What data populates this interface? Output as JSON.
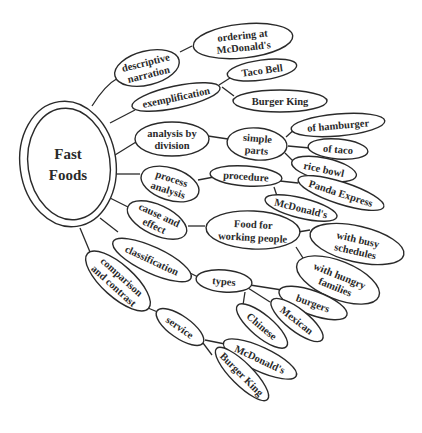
{
  "diagram": {
    "type": "cluster-map",
    "center": {
      "line1": "Fast",
      "line2": "Foods"
    },
    "branches": [
      {
        "label": [
          "descriptive",
          "narration"
        ],
        "children": [
          {
            "label": [
              "ordering at",
              "McDonald's"
            ]
          }
        ]
      },
      {
        "label": [
          "exemplification"
        ],
        "children": [
          {
            "label": [
              "Taco Bell"
            ]
          },
          {
            "label": [
              "Burger King"
            ]
          }
        ]
      },
      {
        "label": [
          "analysis by",
          "division"
        ],
        "children": [
          {
            "label": [
              "simple",
              "parts"
            ],
            "children": [
              {
                "label": [
                  "of hamburger"
                ]
              },
              {
                "label": [
                  "of taco"
                ]
              },
              {
                "label": [
                  "rice bowl"
                ]
              }
            ]
          }
        ]
      },
      {
        "label": [
          "process",
          "analysis"
        ],
        "children": [
          {
            "label": [
              "procedure"
            ],
            "children": [
              {
                "label": [
                  "Panda Express"
                ]
              },
              {
                "label": [
                  "McDonald's"
                ]
              }
            ]
          }
        ]
      },
      {
        "label": [
          "cause and",
          "effect"
        ],
        "children": [
          {
            "label": [
              "Food for",
              "working people"
            ],
            "children": [
              {
                "label": [
                  "with busy",
                  "schedules"
                ]
              },
              {
                "label": [
                  "with hungry",
                  "families"
                ]
              }
            ]
          }
        ]
      },
      {
        "label": [
          "classification"
        ],
        "children": [
          {
            "label": [
              "types"
            ],
            "children": [
              {
                "label": [
                  "burgers"
                ]
              },
              {
                "label": [
                  "Mexican"
                ]
              },
              {
                "label": [
                  "Chinese"
                ]
              }
            ]
          }
        ]
      },
      {
        "label": [
          "comparison",
          "and contrast"
        ],
        "children": [
          {
            "label": [
              "service"
            ],
            "children": [
              {
                "label": [
                  "McDonald's"
                ]
              },
              {
                "label": [
                  "Burger King"
                ]
              }
            ]
          }
        ]
      }
    ]
  },
  "labels": {
    "center_1": "Fast",
    "center_2": "Foods",
    "desc_1": "descriptive",
    "desc_2": "narration",
    "ordering_1": "ordering at",
    "ordering_2": "McDonald's",
    "exempl": "exemplification",
    "taco_bell": "Taco Bell",
    "burger_king_1": "Burger King",
    "analysis_1": "analysis by",
    "analysis_2": "division",
    "simple_1": "simple",
    "simple_2": "parts",
    "hamburger": "of hamburger",
    "taco": "of taco",
    "rice_bowl": "rice bowl",
    "process_1": "process",
    "process_2": "analysis",
    "procedure": "procedure",
    "panda": "Panda Express",
    "mcd_proc": "McDonald's",
    "cause_1": "cause and",
    "cause_2": "effect",
    "food_1": "Food for",
    "food_2": "working people",
    "busy_1": "with busy",
    "busy_2": "schedules",
    "hungry_1": "with hungry",
    "hungry_2": "families",
    "classification": "classification",
    "types": "types",
    "burgers": "burgers",
    "mexican": "Mexican",
    "chinese": "Chinese",
    "compare_1": "comparison",
    "compare_2": "and contrast",
    "service": "service",
    "mcd_service": "McDonald's",
    "burger_king_2": "Burger King"
  },
  "colors": {
    "stroke": "#2a2a2a",
    "background": "#ffffff"
  }
}
